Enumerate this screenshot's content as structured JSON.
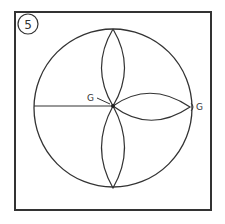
{
  "step_number": "5",
  "labels": {
    "center_point": "G",
    "right_point": "G"
  },
  "colors": {
    "stroke": "#333333",
    "background": "#ffffff"
  }
}
